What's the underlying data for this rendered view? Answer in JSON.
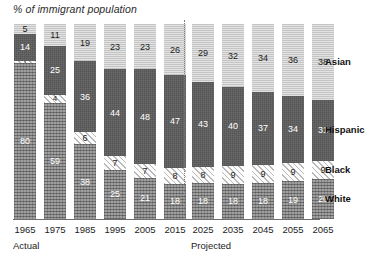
{
  "chart_data": {
    "type": "bar",
    "title": "% of immigrant population",
    "xlabel": "",
    "ylabel": "",
    "ylim": [
      0,
      100
    ],
    "grid": false,
    "stacked": true,
    "legend_position": "right",
    "categories": [
      "1965",
      "1975",
      "1985",
      "1995",
      "2005",
      "2015",
      "2025",
      "2035",
      "2045",
      "2055",
      "2065"
    ],
    "group_labels": [
      "Actual",
      "Projected"
    ],
    "group_spans": [
      [
        "1965",
        "1975",
        "1985",
        "1995",
        "2005",
        "2015"
      ],
      [
        "2025",
        "2035",
        "2045",
        "2055",
        "2065"
      ]
    ],
    "series": [
      {
        "name": "Asian",
        "values": [
          5,
          11,
          19,
          23,
          23,
          26,
          29,
          32,
          34,
          36,
          38
        ]
      },
      {
        "name": "Hispanic",
        "values": [
          14,
          25,
          36,
          44,
          48,
          47,
          43,
          40,
          37,
          34,
          31
        ]
      },
      {
        "name": "Black",
        "values": [
          1,
          4,
          6,
          7,
          7,
          8,
          8,
          9,
          9,
          9,
          9
        ]
      },
      {
        "name": "White",
        "values": [
          80,
          59,
          38,
          25,
          21,
          18,
          18,
          18,
          18,
          19,
          20
        ]
      }
    ],
    "stack_order_top_to_bottom": [
      "Asian",
      "Hispanic",
      "Black",
      "White"
    ],
    "legend": [
      "Asian",
      "Hispanic",
      "Black",
      "White"
    ],
    "colors": {
      "asian": "#d2d2d2",
      "hispanic": "#6a6a6a",
      "black": "#f4f4f4",
      "white": "#8e8e8e",
      "axis": "#6e6e6e",
      "divider": "#808080",
      "text": "#1c1c1c"
    }
  }
}
